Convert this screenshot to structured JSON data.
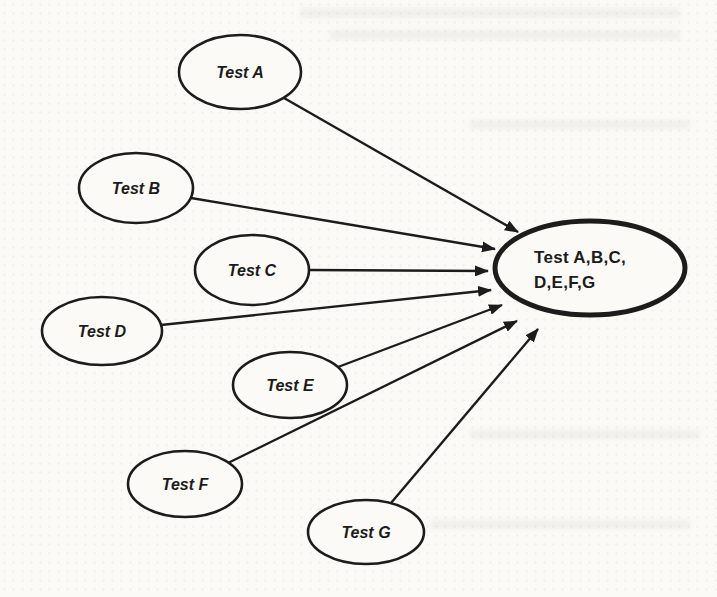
{
  "colors": {
    "ink": "#1c1c1c",
    "paper": "#fbfaf7"
  },
  "diagram": {
    "type": "converging-arrows",
    "nodes": [
      {
        "id": "test-a",
        "label": "Test A"
      },
      {
        "id": "test-b",
        "label": "Test B"
      },
      {
        "id": "test-c",
        "label": "Test C"
      },
      {
        "id": "test-d",
        "label": "Test D"
      },
      {
        "id": "test-e",
        "label": "Test E"
      },
      {
        "id": "test-f",
        "label": "Test F"
      },
      {
        "id": "test-g",
        "label": "Test G"
      },
      {
        "id": "hub",
        "label": "Test A,B,C, D,E,F,G",
        "label_line1": "Test A,B,C,",
        "label_line2": "D,E,F,G"
      }
    ],
    "edges": [
      {
        "from": "test-a",
        "to": "hub"
      },
      {
        "from": "test-b",
        "to": "hub"
      },
      {
        "from": "test-c",
        "to": "hub"
      },
      {
        "from": "test-d",
        "to": "hub"
      },
      {
        "from": "test-e",
        "to": "hub"
      },
      {
        "from": "test-f",
        "to": "hub"
      },
      {
        "from": "test-g",
        "to": "hub"
      }
    ]
  }
}
